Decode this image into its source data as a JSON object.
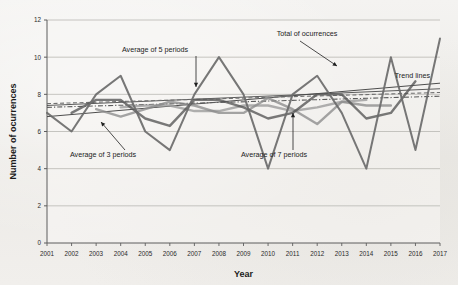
{
  "chart_data": {
    "type": "line",
    "title": "",
    "xlabel": "Year",
    "ylabel": "Number of ocurrences",
    "xlim": [
      2001,
      2017
    ],
    "ylim": [
      0,
      12
    ],
    "yticks": [
      0,
      2,
      4,
      6,
      8,
      10,
      12
    ],
    "grid": true,
    "legend_position": "annotations-inline",
    "categories": [
      2001,
      2002,
      2003,
      2004,
      2005,
      2006,
      2007,
      2008,
      2009,
      2010,
      2011,
      2012,
      2013,
      2014,
      2015,
      2016,
      2017
    ],
    "series": [
      {
        "name": "Total of ocurrences",
        "color": "#6b6b6b",
        "values": [
          7,
          6,
          8,
          9,
          6,
          5,
          8,
          10,
          8,
          4,
          8,
          9,
          7,
          4,
          10,
          5,
          11
        ]
      },
      {
        "name": "Average of 3 periods",
        "color": "#555555",
        "values": [
          null,
          7.0,
          7.7,
          7.7,
          6.7,
          6.3,
          7.7,
          7.7,
          7.3,
          6.7,
          7.0,
          8.0,
          8.0,
          6.7,
          7.0,
          8.7,
          null
        ]
      },
      {
        "name": "Average of 5 periods",
        "color": "#8c8c8c",
        "values": [
          null,
          null,
          7.2,
          6.8,
          7.2,
          7.6,
          7.4,
          7.0,
          7.0,
          7.8,
          7.2,
          6.4,
          7.6,
          7.4,
          7.4,
          null,
          null
        ]
      },
      {
        "name": "Average of 7 periods",
        "color": "#9a9a9a",
        "values": [
          null,
          null,
          null,
          7.3,
          7.4,
          7.4,
          7.1,
          7.1,
          7.4,
          7.4,
          7.1,
          7.3,
          7.6,
          7.7,
          null,
          null,
          null
        ]
      }
    ],
    "trend_lines": [
      {
        "name": "trend-solid-dark",
        "color": "#3a3a3a",
        "style": "solid",
        "x0": 2001,
        "y0": 6.8,
        "x1": 2017,
        "y1": 8.6
      },
      {
        "name": "trend-solid-thin",
        "color": "#4a4a4a",
        "style": "solid",
        "x0": 2001,
        "y0": 7.4,
        "x1": 2017,
        "y1": 8.3
      },
      {
        "name": "trend-dashed",
        "color": "#707070",
        "style": "dashed",
        "x0": 2001,
        "y0": 7.5,
        "x1": 2017,
        "y1": 8.1
      },
      {
        "name": "trend-dash-dot",
        "color": "#5c5c5c",
        "style": "dash-dot",
        "x0": 2001,
        "y0": 7.3,
        "x1": 2017,
        "y1": 7.9
      }
    ],
    "annotations": [
      {
        "name": "annotation-average-5",
        "label": "Average of 5 periods",
        "text_x": 155,
        "text_y": 52,
        "arrow_x1": 196,
        "arrow_y1": 56,
        "arrow_x2": 196,
        "arrow_y2": 87
      },
      {
        "name": "annotation-total",
        "label": "Total of ocurrences",
        "text_x": 307,
        "text_y": 36,
        "arrow_x1": 300,
        "arrow_y1": 41,
        "arrow_x2": 337,
        "arrow_y2": 66
      },
      {
        "name": "annotation-trend-lines",
        "label": "Trend lines",
        "text_x": 430,
        "text_y": 78,
        "arrow_x1": 0,
        "arrow_y1": 0,
        "arrow_x2": 0,
        "arrow_y2": 0
      },
      {
        "name": "annotation-average-3",
        "label": "Average of 3 periods",
        "text_x": 103,
        "text_y": 157,
        "arrow_x1": 125,
        "arrow_y1": 150,
        "arrow_x2": 101,
        "arrow_y2": 122
      },
      {
        "name": "annotation-average-7",
        "label": "Average of 7 periods",
        "text_x": 274,
        "text_y": 157,
        "arrow_x1": 293,
        "arrow_y1": 150,
        "arrow_x2": 293,
        "arrow_y2": 113
      }
    ]
  }
}
